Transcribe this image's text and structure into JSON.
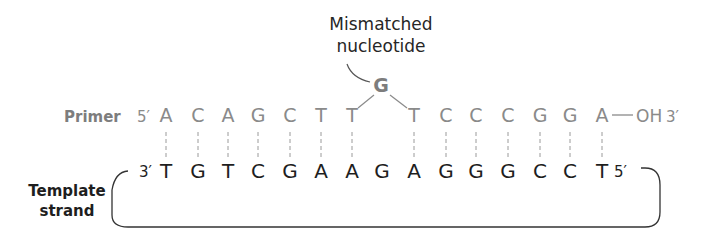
{
  "callout": {
    "line1": "Mismatched",
    "line2": "nucleotide"
  },
  "primer": {
    "label": "Primer",
    "five_prime": "5′",
    "bases_before": [
      "A",
      "C",
      "A",
      "G",
      "C",
      "T",
      "T"
    ],
    "mismatched_base": "G",
    "bases_after": [
      "T",
      "C",
      "C",
      "C",
      "G",
      "G",
      "A"
    ],
    "three_prime_end": "OH",
    "three_prime": "3′",
    "color": "#8a8a8a"
  },
  "template": {
    "label_line1": "Template",
    "label_line2": "strand",
    "three_prime": "3′",
    "bases": [
      "T",
      "G",
      "T",
      "C",
      "G",
      "A",
      "A",
      "G",
      "A",
      "G",
      "G",
      "G",
      "C",
      "C",
      "T"
    ],
    "five_prime": "5′",
    "color": "#1e1e1e"
  }
}
